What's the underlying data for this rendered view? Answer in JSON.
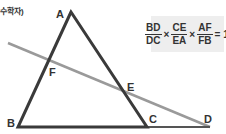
{
  "caption": "수학자)",
  "points": {
    "A": {
      "label": "A",
      "x": 71,
      "y": 12
    },
    "B": {
      "label": "B",
      "x": 18,
      "y": 127
    },
    "C": {
      "label": "C",
      "x": 147,
      "y": 127
    },
    "D": {
      "label": "D",
      "x": 210,
      "y": 127
    },
    "E": {
      "label": "E",
      "x": 124,
      "y": 90
    },
    "F": {
      "label": "F",
      "x": 48,
      "y": 60
    }
  },
  "transversal": {
    "start": {
      "x": 8,
      "y": 43
    },
    "end": {
      "x": 210,
      "y": 127
    }
  },
  "formula": {
    "terms": [
      {
        "num": "BD",
        "den": "DC"
      },
      {
        "num": "CE",
        "den": "EA"
      },
      {
        "num": "AF",
        "den": "FB"
      }
    ],
    "times": "×",
    "equals": "=",
    "result": "1"
  },
  "colors": {
    "triangle": "#3a3a3a",
    "transversal": "#9a9a9a",
    "formula_bg": "#eeeeee"
  }
}
